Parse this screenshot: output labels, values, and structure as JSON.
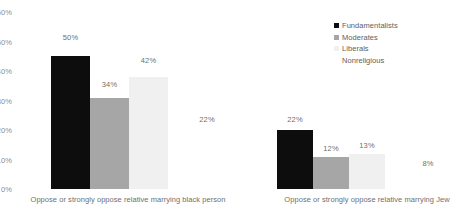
{
  "chart_data": {
    "type": "bar",
    "title": "",
    "xlabel": "",
    "ylabel": "",
    "ylim": [
      0,
      60
    ],
    "grid": false,
    "legend_position": "top-right",
    "y_ticks": [
      "0%",
      "10%",
      "20%",
      "30%",
      "40%",
      "50%",
      "60%"
    ],
    "y_tick_values": [
      0,
      10,
      20,
      30,
      40,
      50,
      60
    ],
    "categories": [
      "Oppose or strongly oppose relative marrying black person",
      "Oppose or strongly oppose relative marrying Jew"
    ],
    "series": [
      {
        "name": "Fundamentalists",
        "color": "#0d0d0d",
        "values": [
          50,
          22
        ],
        "labels": [
          "50%",
          "22%"
        ]
      },
      {
        "name": "Moderates",
        "color": "#a6a6a6",
        "values": [
          34,
          12
        ],
        "labels": [
          "34%",
          "12%"
        ]
      },
      {
        "name": "Liberals",
        "color": "#f0f0f0",
        "values": [
          42,
          13
        ],
        "labels": [
          "42%",
          "13%"
        ]
      },
      {
        "name": "Nonreligious",
        "color": "#ffffff",
        "values": [
          22,
          8
        ],
        "labels": [
          "22%",
          "8%"
        ]
      }
    ]
  },
  "legend": {
    "items": [
      {
        "label": "Fundamentalists",
        "color": "#0d0d0d"
      },
      {
        "label": "Moderates",
        "color": "#a6a6a6"
      },
      {
        "label": "Liberals",
        "color": "#f0f0f0"
      },
      {
        "label": "Nonreligious",
        "color": "#ffffff"
      }
    ]
  }
}
